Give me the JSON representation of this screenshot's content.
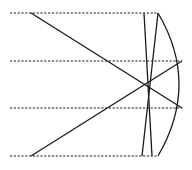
{
  "diagram": {
    "type": "optical-ray-diagram",
    "stroke_color": "#1a1a1a",
    "background": "#ffffff",
    "dashed_rays": [
      {
        "x1": 10,
        "y1": 13,
        "x2": 158,
        "y2": 13
      },
      {
        "x1": 10,
        "y1": 61,
        "x2": 182,
        "y2": 61
      },
      {
        "x1": 10,
        "y1": 108,
        "x2": 182,
        "y2": 108
      },
      {
        "x1": 10,
        "y1": 156,
        "x2": 158,
        "y2": 156
      }
    ],
    "solid_rays": [
      {
        "x1": 31,
        "y1": 13,
        "x2": 182,
        "y2": 108
      },
      {
        "x1": 31,
        "y1": 156,
        "x2": 182,
        "y2": 61
      },
      {
        "x1": 144,
        "y1": 13,
        "x2": 152,
        "y2": 156
      },
      {
        "x1": 158,
        "y1": 13,
        "x2": 142,
        "y2": 156
      }
    ],
    "mirror_arc": {
      "d": "M158,13 Q200,84 158,156"
    },
    "caption": ""
  }
}
